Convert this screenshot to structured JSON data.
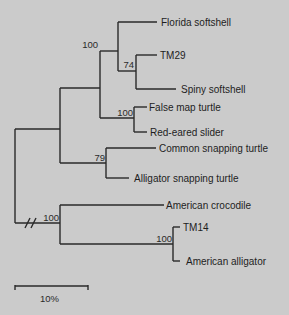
{
  "tree": {
    "type": "phylogenetic-tree",
    "taxa": [
      "Florida softshell",
      "TM29",
      "Spiny softshell",
      "False map turtle",
      "Red-eared slider",
      "Common snapping turtle",
      "Alligator snapping turtle",
      "American crocodile",
      "TM14",
      "American alligator"
    ],
    "bootstrap": {
      "softshell_clade": "100",
      "tm29_spiny": "74",
      "emydid_clade": "100",
      "snapping_clade": "79",
      "crocodilian_clade": "100",
      "tm14_alligator": "100"
    },
    "root_break": true,
    "scale_bar": {
      "label": "10%"
    }
  }
}
